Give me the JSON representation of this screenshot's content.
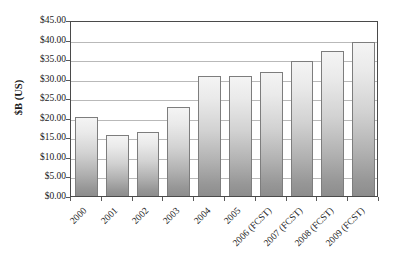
{
  "chart_data": {
    "type": "bar",
    "title": "",
    "subtitle": "",
    "xlabel": "",
    "ylabel": "$B (US)",
    "categories": [
      "2000",
      "2001",
      "2002",
      "2003",
      "2004",
      "2005",
      "2006 (FCST)",
      "2007 (FCST)",
      "2008 (FCST)",
      "2009 (FCST)"
    ],
    "values": [
      20.1,
      15.5,
      16.4,
      22.8,
      30.7,
      30.6,
      31.7,
      34.4,
      37.0,
      39.3
    ],
    "ylim": [
      0,
      45
    ],
    "ytick_step": 5,
    "ytick_labels": [
      "$45.00",
      "$40.00",
      "$35.00",
      "$30.00",
      "$25.00",
      "$20.00",
      "$15.00",
      "$10.00",
      "$5.00",
      "$0.00"
    ],
    "ytick_values": [
      45,
      40,
      35,
      30,
      25,
      20,
      15,
      10,
      5,
      0
    ],
    "grid": true,
    "grid_axis": "y",
    "legend": false,
    "legend_position": "none",
    "series": [
      {
        "name": "$B (US)",
        "values": [
          20.1,
          15.5,
          16.4,
          22.8,
          30.7,
          30.6,
          31.7,
          34.4,
          37.0,
          39.3
        ]
      }
    ],
    "bar_fill": "gradient-light-to-gray",
    "bar_border_color": "#7d7d7d",
    "plot_border_color": "#4a4a4a",
    "gridline_color": "#b9b9b9",
    "background_color": "#ffffff",
    "xtick_label_rotation": -45
  }
}
